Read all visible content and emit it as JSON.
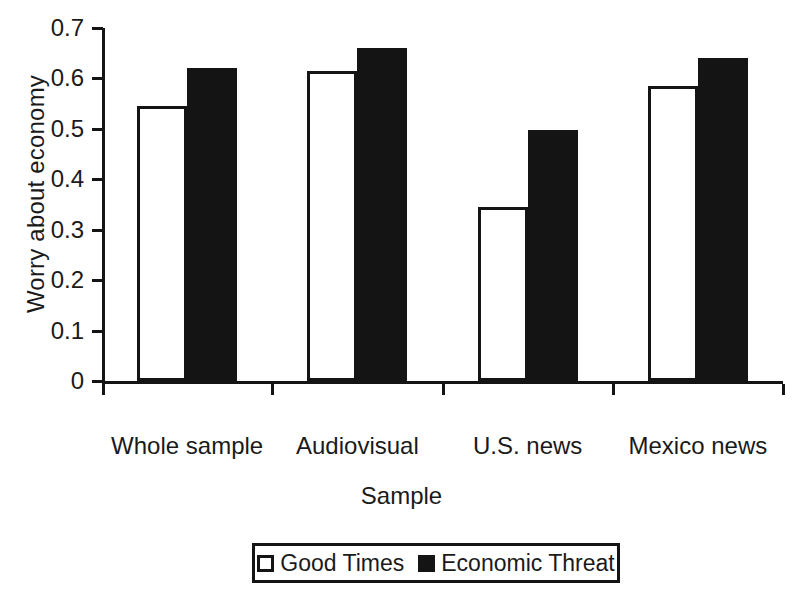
{
  "chart_data": {
    "type": "bar",
    "title": "",
    "xlabel": "Sample",
    "ylabel": "Worry about economy",
    "categories": [
      "Whole sample",
      "Audiovisual",
      "U.S. news",
      "Mexico news"
    ],
    "series": [
      {
        "name": "Good Times",
        "values": [
          0.545,
          0.615,
          0.345,
          0.585
        ],
        "color": "#ffffff"
      },
      {
        "name": "Economic Threat",
        "values": [
          0.62,
          0.66,
          0.497,
          0.64
        ],
        "color": "#141414"
      }
    ],
    "ylim": [
      0,
      0.7
    ],
    "yticks": [
      0,
      0.1,
      0.2,
      0.3,
      0.4,
      0.5,
      0.6,
      0.7
    ],
    "ytick_labels": [
      "0",
      "0.1",
      "0.2",
      "0.3",
      "0.4",
      "0.5",
      "0.6",
      "0.7"
    ],
    "grid": false,
    "legend_position": "bottom-center",
    "legend_entries": [
      "Good Times",
      "Economic Threat"
    ]
  },
  "axes": {
    "y_title": "Worry about economy",
    "x_title": "Sample"
  },
  "legend": {
    "items": [
      {
        "label": "Good Times",
        "swatch": "white-square-outline"
      },
      {
        "label": "Economic Threat",
        "swatch": "black-square-filled"
      }
    ]
  }
}
